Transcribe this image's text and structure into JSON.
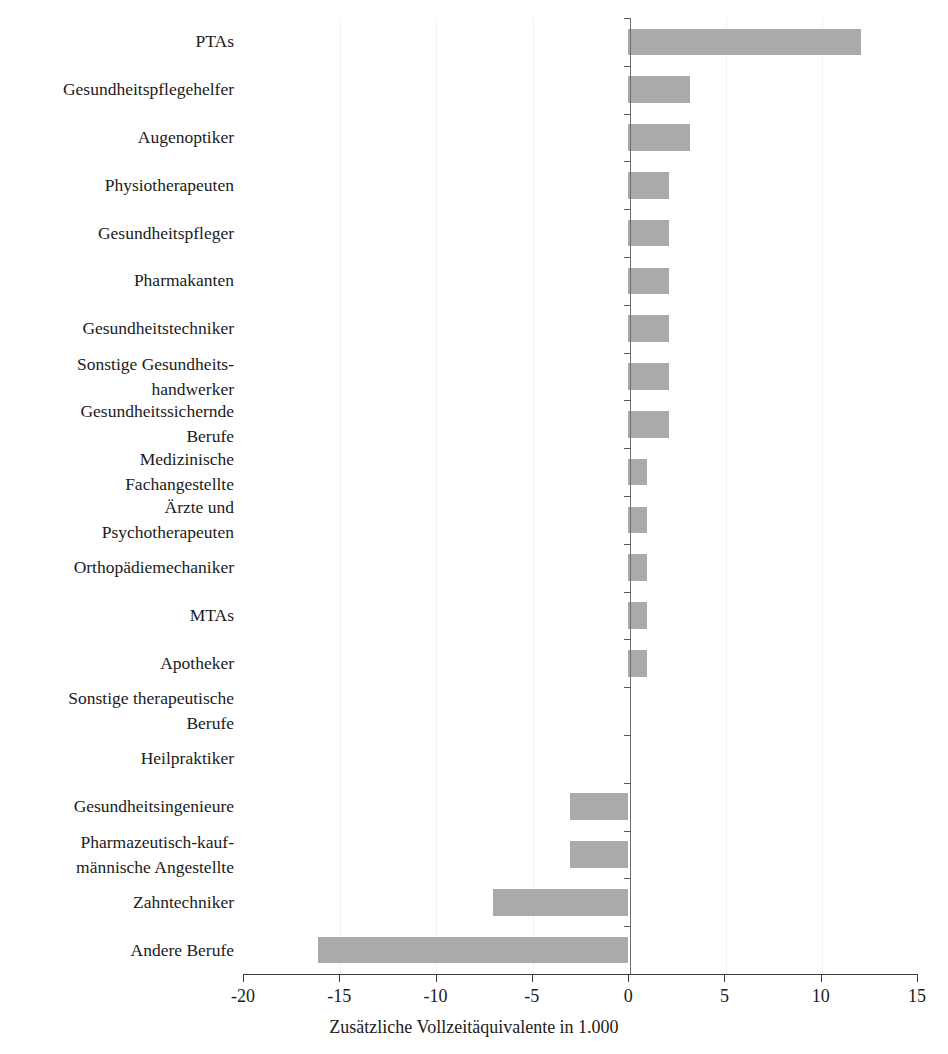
{
  "chart_data": {
    "type": "bar",
    "orientation": "horizontal",
    "title": "",
    "subtitle": "",
    "xlabel": "Zusätzliche Vollzeitäquivalente in 1.000",
    "ylabel": "",
    "xlim": [
      -20,
      15
    ],
    "xticks": [
      -20,
      -15,
      -10,
      -5,
      0,
      5,
      10,
      15
    ],
    "xtick_labels": [
      "-20",
      "-15",
      "-10",
      "-5",
      "0",
      "5",
      "10",
      "15"
    ],
    "grid": false,
    "legend": null,
    "bar_color": "#aaaaaa",
    "axis_color": "#3a3a3a",
    "categories": [
      "PTAs",
      "Gesundheitspflegehelfer",
      "Augenoptiker",
      "Physiotherapeuten",
      "Gesundheitspfleger",
      "Pharmakanten",
      "Gesundheitstechniker",
      "Sonstige Gesundheits-\nhandwerker",
      "Gesundheitssichernde\nBerufe",
      "Medizinische\nFachangestellte",
      "Ärzte und\nPsychotherapeuten",
      "Orthopädiemechaniker",
      "MTAs",
      "Apotheker",
      "Sonstige therapeutische\nBerufe",
      "Heilpraktiker",
      "Gesundheitsingenieure",
      "Pharmazeutisch-kauf-\nmännische Angestellte",
      "Zahntechniker",
      "Andere Berufe"
    ],
    "values": [
      12.1,
      3.2,
      3.2,
      2.1,
      2.1,
      2.1,
      2.1,
      2.1,
      2.1,
      1.0,
      1.0,
      1.0,
      1.0,
      1.0,
      0.0,
      0.0,
      -3.0,
      -3.0,
      -7.0,
      -16.1
    ]
  }
}
